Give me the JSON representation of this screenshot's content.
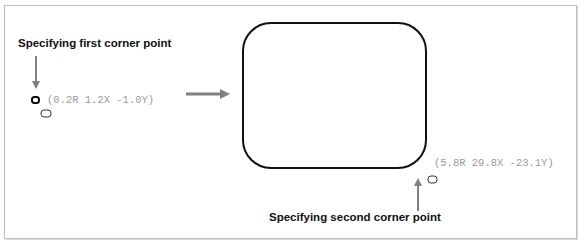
{
  "annotations": {
    "first_corner_label": "Specifying first corner point",
    "second_corner_label": "Specifying second corner point"
  },
  "coordinates": {
    "first": "(0.2R 1.2X -1.0Y)",
    "second": "(5.8R 29.8X -23.1Y)"
  },
  "colors": {
    "arrow": "#808080",
    "shape_stroke": "#111111",
    "coord_text": "#9a9a9a"
  }
}
